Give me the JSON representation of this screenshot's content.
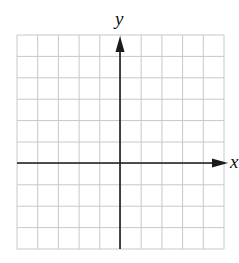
{
  "diagram": {
    "type": "coordinate-grid",
    "axes": {
      "x_label": "x",
      "y_label": "y"
    },
    "grid": {
      "columns": 10,
      "rows": 10,
      "x_units_left": 5,
      "x_units_right": 5,
      "y_units_up": 6,
      "y_units_down": 4,
      "tick_labels": "none"
    },
    "colors": {
      "grid": "#c8c8c8",
      "axis": "#1a1a1a",
      "background": "#ffffff"
    }
  }
}
